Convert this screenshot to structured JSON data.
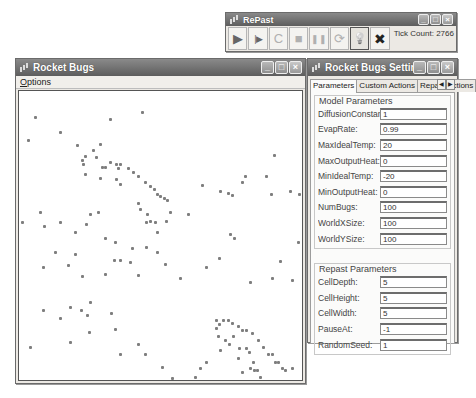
{
  "repast_window": {
    "title": "RePast",
    "toolbar": [
      {
        "name": "run-button",
        "icon": "▶",
        "state": "normal"
      },
      {
        "name": "step-button",
        "icon": "|▶",
        "state": "normal"
      },
      {
        "name": "setup-button",
        "icon": "C",
        "state": "dim"
      },
      {
        "name": "stop-button",
        "icon": "■",
        "state": "dim"
      },
      {
        "name": "pause-button",
        "icon": "❚❚",
        "state": "dim"
      },
      {
        "name": "reset-button",
        "icon": "⟳",
        "state": "dim"
      },
      {
        "name": "settings-lightbulb-button",
        "icon": "💡",
        "state": "pressed"
      },
      {
        "name": "exit-button",
        "icon": "✖",
        "state": "normal"
      }
    ],
    "tick_label": "Tick Count:",
    "tick_value": "2766"
  },
  "bugs_window": {
    "title": "Rocket Bugs",
    "menu": {
      "options_label": "Options"
    },
    "bug_color": "#7e7e7e",
    "bugs": [
      [
        15,
        25
      ],
      [
        122,
        20
      ],
      [
        90,
        27
      ],
      [
        40,
        40
      ],
      [
        8,
        48
      ],
      [
        57,
        53
      ],
      [
        65,
        64
      ],
      [
        62,
        68
      ],
      [
        63,
        72
      ],
      [
        73,
        58
      ],
      [
        80,
        52
      ],
      [
        76,
        65
      ],
      [
        82,
        75
      ],
      [
        85,
        75
      ],
      [
        90,
        70
      ],
      [
        96,
        72
      ],
      [
        100,
        72
      ],
      [
        98,
        76
      ],
      [
        108,
        76
      ],
      [
        113,
        80
      ],
      [
        118,
        84
      ],
      [
        125,
        90
      ],
      [
        130,
        94
      ],
      [
        134,
        97
      ],
      [
        137,
        102
      ],
      [
        140,
        104
      ],
      [
        144,
        106
      ],
      [
        147,
        108
      ],
      [
        65,
        82
      ],
      [
        80,
        86
      ],
      [
        96,
        87
      ],
      [
        100,
        92
      ],
      [
        118,
        111
      ],
      [
        120,
        117
      ],
      [
        127,
        122
      ],
      [
        135,
        130
      ],
      [
        150,
        120
      ],
      [
        168,
        122
      ],
      [
        182,
        93
      ],
      [
        200,
        99
      ],
      [
        208,
        101
      ],
      [
        212,
        103
      ],
      [
        222,
        90
      ],
      [
        225,
        84
      ],
      [
        246,
        84
      ],
      [
        251,
        102
      ],
      [
        254,
        63
      ],
      [
        270,
        99
      ],
      [
        279,
        102
      ],
      [
        284,
        112
      ],
      [
        278,
        150
      ],
      [
        210,
        142
      ],
      [
        146,
        129
      ],
      [
        2,
        130
      ],
      [
        20,
        120
      ],
      [
        24,
        134
      ],
      [
        40,
        130
      ],
      [
        55,
        140
      ],
      [
        66,
        132
      ],
      [
        70,
        122
      ],
      [
        78,
        120
      ],
      [
        85,
        146
      ],
      [
        95,
        150
      ],
      [
        112,
        156
      ],
      [
        126,
        130
      ],
      [
        130,
        129
      ],
      [
        137,
        140
      ],
      [
        23,
        175
      ],
      [
        35,
        160
      ],
      [
        48,
        173
      ],
      [
        55,
        162
      ],
      [
        62,
        184
      ],
      [
        70,
        210
      ],
      [
        85,
        182
      ],
      [
        94,
        168
      ],
      [
        100,
        168
      ],
      [
        110,
        170
      ],
      [
        118,
        183
      ],
      [
        126,
        155
      ],
      [
        137,
        160
      ],
      [
        145,
        172
      ],
      [
        160,
        186
      ],
      [
        186,
        175
      ],
      [
        199,
        166
      ],
      [
        214,
        146
      ],
      [
        230,
        190
      ],
      [
        252,
        186
      ],
      [
        260,
        169
      ],
      [
        272,
        188
      ],
      [
        23,
        218
      ],
      [
        40,
        226
      ],
      [
        50,
        215
      ],
      [
        61,
        218
      ],
      [
        67,
        223
      ],
      [
        69,
        240
      ],
      [
        91,
        221
      ],
      [
        95,
        237
      ],
      [
        100,
        262
      ],
      [
        118,
        252
      ],
      [
        125,
        262
      ],
      [
        142,
        275
      ],
      [
        152,
        286
      ],
      [
        162,
        302
      ],
      [
        180,
        276
      ],
      [
        186,
        270
      ],
      [
        208,
        302
      ],
      [
        230,
        276
      ],
      [
        262,
        298
      ],
      [
        270,
        310
      ],
      [
        50,
        250
      ],
      [
        10,
        255
      ],
      [
        196,
        228
      ],
      [
        199,
        232
      ],
      [
        203,
        228
      ],
      [
        208,
        228
      ],
      [
        212,
        231
      ],
      [
        218,
        234
      ],
      [
        222,
        238
      ],
      [
        226,
        238
      ],
      [
        232,
        241
      ],
      [
        238,
        248
      ],
      [
        243,
        255
      ],
      [
        248,
        262
      ],
      [
        252,
        262
      ],
      [
        255,
        270
      ],
      [
        258,
        270
      ],
      [
        262,
        276
      ],
      [
        265,
        278
      ],
      [
        272,
        276
      ],
      [
        196,
        236
      ],
      [
        198,
        244
      ],
      [
        205,
        248
      ],
      [
        209,
        252
      ],
      [
        213,
        244
      ],
      [
        219,
        256
      ],
      [
        226,
        256
      ],
      [
        229,
        260
      ],
      [
        233,
        270
      ],
      [
        234,
        278
      ],
      [
        237,
        278
      ],
      [
        240,
        285
      ],
      [
        243,
        295
      ],
      [
        249,
        300
      ],
      [
        255,
        298
      ],
      [
        258,
        302
      ],
      [
        262,
        304
      ],
      [
        200,
        258
      ],
      [
        218,
        266
      ],
      [
        222,
        280
      ],
      [
        231,
        300
      ],
      [
        233,
        298
      ],
      [
        236,
        300
      ],
      [
        175,
        285
      ],
      [
        178,
        293
      ],
      [
        180,
        297
      ],
      [
        165,
        310
      ],
      [
        150,
        300
      ],
      [
        210,
        310
      ]
    ]
  },
  "settings_window": {
    "title": "Rocket Bugs Settings",
    "tabs": [
      "Parameters",
      "Custom Actions",
      "Repast Actions"
    ],
    "active_tab": 0,
    "model_parameters": {
      "legend": "Model Parameters",
      "fields": [
        {
          "label": "DiffusionConstant:",
          "value": "1"
        },
        {
          "label": "EvapRate:",
          "value": "0.99"
        },
        {
          "label": "MaxIdealTemp:",
          "value": "20"
        },
        {
          "label": "MaxOutputHeat:",
          "value": "0"
        },
        {
          "label": "MinIdealTemp:",
          "value": "-20"
        },
        {
          "label": "MinOutputHeat:",
          "value": "0"
        },
        {
          "label": "NumBugs:",
          "value": "100"
        },
        {
          "label": "WorldXSize:",
          "value": "100"
        },
        {
          "label": "WorldYSize:",
          "value": "100"
        }
      ]
    },
    "repast_parameters": {
      "legend": "Repast Parameters",
      "fields": [
        {
          "label": "CellDepth:",
          "value": "5"
        },
        {
          "label": "CellHeight:",
          "value": "5"
        },
        {
          "label": "CellWidth:",
          "value": "5"
        },
        {
          "label": "PauseAt:",
          "value": "-1"
        },
        {
          "label": "RandomSeed:",
          "value": "1"
        }
      ]
    }
  }
}
